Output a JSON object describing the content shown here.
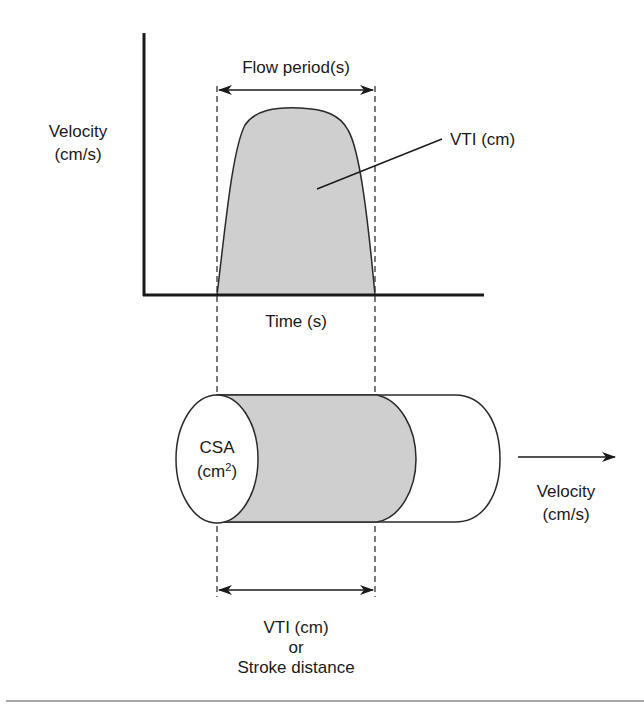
{
  "diagram": {
    "graph": {
      "y_axis_label_line1": "Velocity",
      "y_axis_label_line2": "(cm/s)",
      "x_axis_label": "Time (s)",
      "flow_period_label": "Flow period(s)",
      "area_label": "VTI (cm)"
    },
    "cylinder": {
      "cross_section_label_line1": "CSA",
      "cross_section_label_unit": "(cm",
      "cross_section_label_exponent": "2",
      "cross_section_label_close": ")",
      "velocity_label_line1": "Velocity",
      "velocity_label_line2": "(cm/s)",
      "distance_label_line1": "VTI (cm)",
      "distance_label_line2": "or",
      "distance_label_line3": "Stroke distance"
    },
    "colors": {
      "shaded_fill": "#cfcfcf",
      "line": "#1a1a1a",
      "divider": "#a8a8a8"
    }
  }
}
